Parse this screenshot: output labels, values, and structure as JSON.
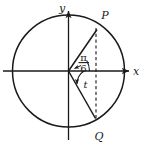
{
  "figure": {
    "background_color": "#ffffff",
    "stroke_color": "#1a1a1a",
    "axes": {
      "x_label": "x",
      "y_label": "y"
    },
    "points": [
      {
        "id": "P",
        "label": "P",
        "angle_deg": 30,
        "angle_expression": "π/6",
        "position": "upper-right-on-circle"
      },
      {
        "id": "Q",
        "label": "Q",
        "angle_deg": -75,
        "angle_expression": "−t",
        "position": "lower-right-on-circle"
      }
    ],
    "angle_labels": [
      {
        "id": "pi-over-6",
        "numerator": "π",
        "denominator": "6",
        "kind": "fraction",
        "measured_from": "positive-x-axis",
        "to": "ray-OP"
      },
      {
        "id": "t",
        "text": "t",
        "kind": "variable",
        "measured_from": "positive-x-axis",
        "to": "ray-OQ"
      }
    ],
    "segments": [
      {
        "id": "radius-OP",
        "from": "origin",
        "to": "P",
        "style": "solid"
      },
      {
        "id": "radius-OQ",
        "from": "origin",
        "to": "Q",
        "style": "solid"
      },
      {
        "id": "chord-PQ",
        "from": "P",
        "to": "Q",
        "style": "dashed"
      }
    ],
    "circle": {
      "id": "unit-circle",
      "style": "solid"
    }
  }
}
